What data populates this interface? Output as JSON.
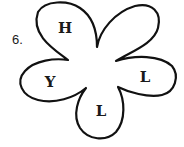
{
  "puzzle": {
    "number_label": "6.",
    "stroke_color": "#111111",
    "petals": [
      {
        "position": "top-left",
        "letter": "H"
      },
      {
        "position": "top-right",
        "letter": ""
      },
      {
        "position": "right",
        "letter": "L"
      },
      {
        "position": "bottom",
        "letter": "L"
      },
      {
        "position": "left",
        "letter": "Y"
      }
    ]
  }
}
